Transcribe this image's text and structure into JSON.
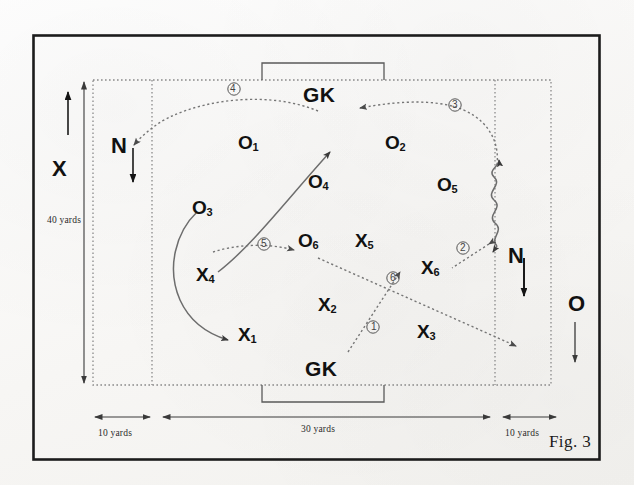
{
  "figure": {
    "caption": "Fig. 3"
  },
  "dimensions": {
    "left_zone_label": "10 yards",
    "middle_zone_label": "30 yards",
    "right_zone_label": "10 yards",
    "height_label": "40 yards"
  },
  "side_keys": [
    {
      "name": "key-x-team",
      "label": "X",
      "arrow": "up"
    },
    {
      "name": "key-o-team",
      "label": "O",
      "arrow": "down"
    }
  ],
  "neutral_players": [
    {
      "name": "neutral-left",
      "label": "N",
      "arrow": "down"
    },
    {
      "name": "neutral-right",
      "label": "N",
      "arrow": "down"
    }
  ],
  "goalkeepers": [
    {
      "name": "goalkeeper-top",
      "label": "GK"
    },
    {
      "name": "goalkeeper-bottom",
      "label": "GK"
    }
  ],
  "team_o": [
    {
      "label": "O",
      "number": "1"
    },
    {
      "label": "O",
      "number": "2"
    },
    {
      "label": "O",
      "number": "3"
    },
    {
      "label": "O",
      "number": "4"
    },
    {
      "label": "O",
      "number": "5"
    },
    {
      "label": "O",
      "number": "6"
    }
  ],
  "team_x": [
    {
      "label": "X",
      "number": "1"
    },
    {
      "label": "X",
      "number": "2"
    },
    {
      "label": "X",
      "number": "3"
    },
    {
      "label": "X",
      "number": "4"
    },
    {
      "label": "X",
      "number": "5"
    },
    {
      "label": "X",
      "number": "6"
    }
  ],
  "sequence_markers": [
    {
      "id": "1",
      "glyph": "①"
    },
    {
      "id": "2",
      "glyph": "②"
    },
    {
      "id": "3",
      "glyph": "③"
    },
    {
      "id": "4",
      "glyph": "④"
    },
    {
      "id": "5",
      "glyph": "⑤"
    },
    {
      "id": "6",
      "glyph": "⑥"
    }
  ],
  "colors": {
    "ink": "#111111",
    "line": "#6d6d6d",
    "border": "#1c1c1c",
    "paper": "#fbfbfa"
  }
}
